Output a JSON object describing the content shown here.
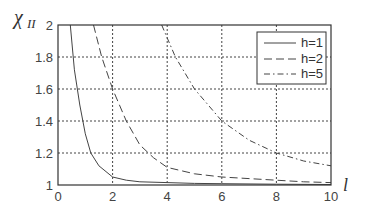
{
  "chart_data": {
    "type": "line",
    "title": "",
    "xlabel": "l",
    "ylabel": "χ_II",
    "xlim": [
      0,
      10
    ],
    "ylim": [
      1,
      2
    ],
    "grid": true,
    "legend_position": "upper right",
    "x_ticks": [
      "0",
      "2",
      "4",
      "6",
      "8",
      "10"
    ],
    "y_ticks": [
      "1",
      "1.2",
      "1.4",
      "1.6",
      "1.8",
      "2"
    ],
    "series": [
      {
        "name": "h=1",
        "style": "solid",
        "x": [
          0.45,
          0.6,
          0.8,
          1.0,
          1.2,
          1.5,
          2.0,
          2.5,
          3.0,
          4.0,
          5.0,
          6.0,
          8.0,
          10.0
        ],
        "y": [
          2.0,
          1.72,
          1.5,
          1.32,
          1.2,
          1.12,
          1.05,
          1.03,
          1.02,
          1.015,
          1.01,
          1.008,
          1.005,
          1.003
        ]
      },
      {
        "name": "h=2",
        "style": "dashed",
        "x": [
          1.3,
          1.6,
          2.0,
          2.5,
          3.0,
          3.5,
          4.0,
          5.0,
          6.0,
          7.0,
          8.0,
          9.0,
          10.0
        ],
        "y": [
          2.0,
          1.8,
          1.6,
          1.4,
          1.25,
          1.17,
          1.11,
          1.07,
          1.05,
          1.04,
          1.03,
          1.02,
          1.015
        ]
      },
      {
        "name": "h=5",
        "style": "dashdot",
        "x": [
          3.8,
          4.3,
          5.0,
          5.5,
          6.0,
          7.0,
          8.0,
          9.0,
          10.0
        ],
        "y": [
          2.0,
          1.8,
          1.6,
          1.5,
          1.4,
          1.28,
          1.2,
          1.15,
          1.12
        ]
      }
    ]
  },
  "legend": {
    "items": [
      "h=1",
      "h=2",
      "h=5"
    ]
  },
  "axes": {
    "xlabel": "l",
    "ylabel_main": "χ",
    "ylabel_sub": "II"
  }
}
